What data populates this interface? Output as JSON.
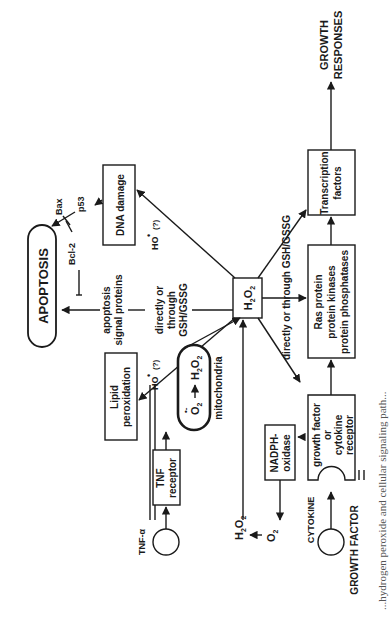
{
  "figure": {
    "orientation": "rotated-90-ccw",
    "nodes": {
      "apoptosis": "APOPTOSIS",
      "bax": "Bax",
      "bcl2": "Bcl-2",
      "p53": "p53",
      "dna_damage": "DNA damage",
      "apoptosis_signal_line1": "apoptosis",
      "apoptosis_signal_line2": "signal proteins",
      "lipid_line1": "Lipid",
      "lipid_line2": "peroxidation",
      "ho_radical_1": "HO",
      "ho_q_1": "(?)",
      "ho_radical_2": "HO",
      "ho_q_2": "(?)",
      "directly_line1": "directly or",
      "directly_line2": "through",
      "directly_line3": "GSH/GSSG",
      "h2o2_center": "H2O2",
      "mito_o2": "O",
      "mito_h2o2": "H2O2",
      "mitochondria": "mitochondria",
      "directly_through_upper": "directly or through GSH/GSSG",
      "directly_through_lower": "directly or through GSH/GSSG",
      "ras_line1": "Ras protein",
      "ras_line2": "protein kinases",
      "ras_line3": "protein phosphatases",
      "tf_line1": "Transcription",
      "tf_line2": "factors",
      "growth_line1": "GROWTH",
      "growth_line2": "RESPONSES",
      "tnf_alpha": "TNF-α",
      "tnf_rec_line1": "TNF",
      "tnf_rec_line2": "receptor",
      "nadph_line1": "NADPH-",
      "nadph_line2": "oxidase",
      "h2o2_out": "H2O2",
      "o2_out": "O2",
      "gfr_line1": "growth factor",
      "gfr_line2": "or",
      "gfr_line3": "cytokine",
      "gfr_line4": "receptor",
      "cytokine": "CYTOKINE",
      "growth_factor": "GROWTH FACTOR"
    },
    "caption_fragment": "...hydrogen peroxide and cellular signaling path..."
  }
}
